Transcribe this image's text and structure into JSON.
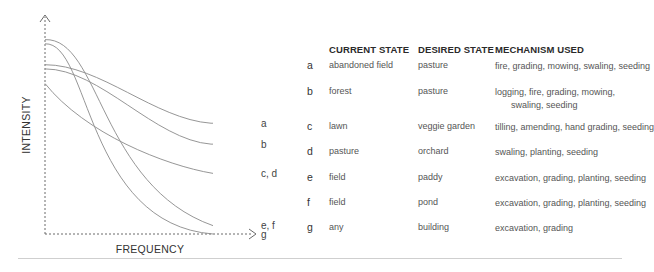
{
  "chart_data": {
    "type": "line",
    "title": "",
    "xlabel": "FREQUENCY",
    "ylabel": "INTENSITY",
    "x_range": [
      0,
      1
    ],
    "y_range": [
      0,
      1
    ],
    "grid": false,
    "legend": "right-end labels",
    "series": [
      {
        "name": "a",
        "start": 0.81,
        "end": 0.53,
        "shape": "gentle-sigmoid"
      },
      {
        "name": "b",
        "start": 0.79,
        "end": 0.43,
        "shape": "gentle-sigmoid"
      },
      {
        "name": "c, d",
        "start": 0.72,
        "end": 0.29,
        "shape": "concave-decay"
      },
      {
        "name": "e, f",
        "start": 0.93,
        "end": 0.04,
        "shape": "steep-sigmoid"
      },
      {
        "name": "g",
        "start": 0.91,
        "end": 0.0,
        "shape": "steeper-sigmoid"
      }
    ]
  },
  "table": {
    "headers": [
      "CURRENT STATE",
      "DESIRED STATE",
      "MECHANISM USED"
    ],
    "rows": [
      {
        "key": "a",
        "current": "abandoned field",
        "desired": "pasture",
        "mechanism": "fire, grading, mowing, swaling, seeding",
        "mechanism_wrap": ""
      },
      {
        "key": "b",
        "current": "forest",
        "desired": "pasture",
        "mechanism": "logging, fire, grading, mowing,",
        "mechanism_wrap": "swaling, seeding"
      },
      {
        "key": "c",
        "current": "lawn",
        "desired": "veggie garden",
        "mechanism": "tilling, amending, hand grading, seeding",
        "mechanism_wrap": ""
      },
      {
        "key": "d",
        "current": "pasture",
        "desired": "orchard",
        "mechanism": "swaling, planting, seeding",
        "mechanism_wrap": ""
      },
      {
        "key": "e",
        "current": "field",
        "desired": "paddy",
        "mechanism": "excavation, grading, planting, seeding",
        "mechanism_wrap": ""
      },
      {
        "key": "f",
        "current": "field",
        "desired": "pond",
        "mechanism": "excavation, grading, planting, seeding",
        "mechanism_wrap": ""
      },
      {
        "key": "g",
        "current": "any",
        "desired": "building",
        "mechanism": "excavation, grading",
        "mechanism_wrap": ""
      }
    ]
  }
}
